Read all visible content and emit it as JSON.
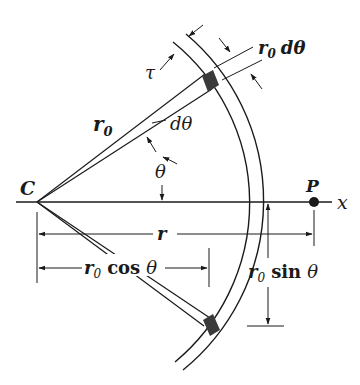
{
  "diagram": {
    "colors": {
      "stroke": "#1a1a1a",
      "element": "#3a3a3a",
      "background": "#ffffff"
    },
    "labels": {
      "center": "C",
      "point": "P",
      "axis": "x",
      "radius": "r",
      "radius_sub": "0",
      "thickness": "τ",
      "arc_length": "dθ",
      "d_theta": "dθ",
      "theta": "θ",
      "distance": "r",
      "cos_label": "cos",
      "sin_label": "sin",
      "theta_sym": "θ"
    },
    "annotations": {
      "ring_thickness": "τ",
      "element_width": "r0 dθ",
      "radial_distance": "r0",
      "angle": "θ",
      "differential_angle": "dθ",
      "horizontal_distance_to_P": "r",
      "horizontal_projection": "r0 cos θ",
      "vertical_projection": "r0 sin θ"
    }
  }
}
